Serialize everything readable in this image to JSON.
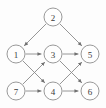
{
  "figure": {
    "background_color": "#fdfdfd",
    "node_fill_color": "#fefefe",
    "node_stroke_color": "#8d8d8d",
    "edge_color": "#8a8a8a",
    "label_color": "#3a3a3a",
    "node_radius": 9
  },
  "chart_data": {
    "type": "diagram",
    "graph_type": "directed",
    "title": "",
    "nodes": [
      {
        "id": "1",
        "label": "1",
        "x": 16,
        "y": 54
      },
      {
        "id": "2",
        "label": "2",
        "x": 53,
        "y": 17
      },
      {
        "id": "3",
        "label": "3",
        "x": 53,
        "y": 54
      },
      {
        "id": "4",
        "label": "4",
        "x": 53,
        "y": 91
      },
      {
        "id": "5",
        "label": "5",
        "x": 90,
        "y": 54
      },
      {
        "id": "6",
        "label": "6",
        "x": 90,
        "y": 91
      },
      {
        "id": "7",
        "label": "7",
        "x": 16,
        "y": 91
      }
    ],
    "edges": [
      {
        "from": "2",
        "to": "1",
        "directed": true
      },
      {
        "from": "2",
        "to": "5",
        "directed": true
      },
      {
        "from": "1",
        "to": "3",
        "directed": true
      },
      {
        "from": "1",
        "to": "4",
        "directed": true
      },
      {
        "from": "7",
        "to": "3",
        "directed": true
      },
      {
        "from": "7",
        "to": "4",
        "directed": true
      },
      {
        "from": "3",
        "to": "5",
        "directed": true
      },
      {
        "from": "3",
        "to": "6",
        "directed": true
      },
      {
        "from": "4",
        "to": "5",
        "directed": true
      },
      {
        "from": "4",
        "to": "6",
        "directed": true
      }
    ],
    "node_count": 7,
    "edge_count": 10
  }
}
